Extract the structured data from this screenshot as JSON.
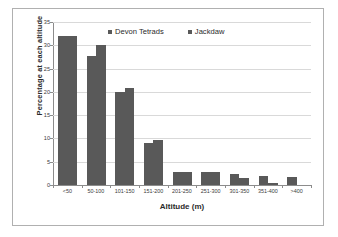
{
  "chart_data": {
    "type": "bar",
    "title": "",
    "subtitle": "",
    "xlabel": "Altitude (m)",
    "ylabel": "Percentage at each altitude",
    "categories": [
      "<50",
      "50-100",
      "101-150",
      "151-200",
      "201-250",
      "251-300",
      "301-350",
      "351-400",
      ">400"
    ],
    "series": [
      {
        "name": "Devon Tetrads",
        "values": [
          32.0,
          27.7,
          20.0,
          9.0,
          2.8,
          2.9,
          2.3,
          1.9,
          1.8
        ]
      },
      {
        "name": "Jackdaw",
        "values": [
          32.0,
          30.0,
          20.8,
          9.6,
          2.8,
          2.8,
          1.5,
          0.5,
          0.0
        ]
      }
    ],
    "ylim": [
      0,
      35
    ],
    "ytick_values": [
      0,
      5,
      10,
      15,
      20,
      25,
      30,
      35
    ],
    "ytick_labels": [
      "0",
      "5",
      "10",
      "15",
      "20",
      "25",
      "30",
      "35"
    ],
    "grid": true,
    "grid_axis": "y",
    "legend_position": "top-center",
    "bar_color": "#595959",
    "gridline_color": "#d9d9d9",
    "axis_color": "#8c8c8c",
    "frame_color": "#b0b0b0",
    "background_color": "#ffffff"
  },
  "legend": {
    "entries": [
      {
        "label": "Devon Tetrads",
        "marker": "square-marker-icon"
      },
      {
        "label": "Jackdaw",
        "marker": "square-marker-icon"
      }
    ]
  }
}
